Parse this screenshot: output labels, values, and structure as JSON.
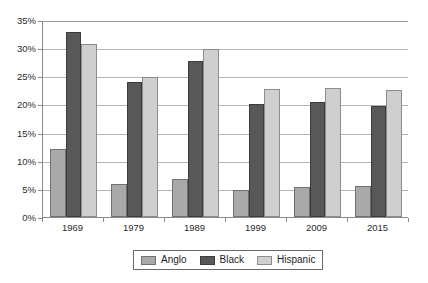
{
  "chart_data": {
    "type": "bar",
    "title": "",
    "subtitle": "",
    "xlabel": "",
    "ylabel": "",
    "categories": [
      "1969",
      "1979",
      "1989",
      "1999",
      "2009",
      "2015"
    ],
    "series": [
      {
        "name": "Anglo",
        "color": "#a9a9a9",
        "values": [
          12.0,
          5.9,
          6.8,
          4.8,
          5.4,
          5.5
        ]
      },
      {
        "name": "Black",
        "color": "#585858",
        "values": [
          32.9,
          23.9,
          27.8,
          20.0,
          20.5,
          19.8
        ]
      },
      {
        "name": "Hispanic",
        "color": "#cfcfcf",
        "values": [
          30.7,
          24.8,
          29.8,
          22.7,
          23.0,
          22.5
        ]
      }
    ],
    "ylim": [
      0,
      35
    ],
    "ytick_values": [
      0,
      5,
      10,
      15,
      20,
      25,
      30,
      35
    ],
    "ytick_labels": [
      "0%",
      "5%",
      "10%",
      "15%",
      "20%",
      "25%",
      "30%",
      "35%"
    ],
    "grid": true,
    "legend_position": "bottom-center",
    "value_suffix": "%"
  },
  "legend": {
    "entries": [
      {
        "label": "Anglo",
        "swatch": "anglo-swatch"
      },
      {
        "label": "Black",
        "swatch": "black-swatch"
      },
      {
        "label": "Hispanic",
        "swatch": "hispanic-swatch"
      }
    ]
  },
  "axes": {
    "y_labels": [
      "35%",
      "30%",
      "25%",
      "20%",
      "15%",
      "10%",
      "5%",
      "0%"
    ],
    "x_labels": [
      "1969",
      "1979",
      "1989",
      "1999",
      "2009",
      "2015"
    ]
  }
}
